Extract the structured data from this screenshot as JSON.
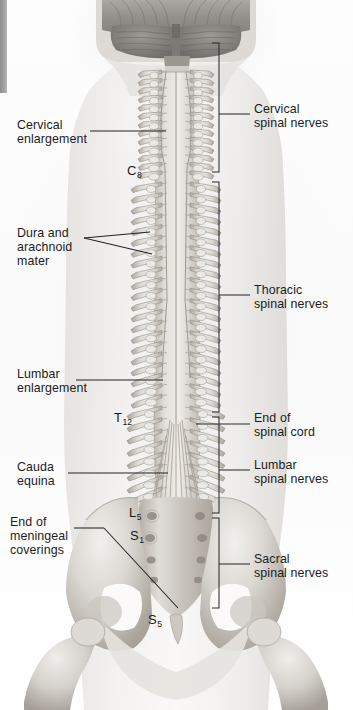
{
  "figure": {
    "style": "grayscale anatomical illustration",
    "width": 353,
    "height": 710
  },
  "colors": {
    "ink": "#1c1c1c",
    "leader_line": "#2a2a2a",
    "bracket": "#3a3a3a",
    "bone_light": "#e8e6e3",
    "bone_mid": "#c9c5c0",
    "bone_dark": "#9a948d",
    "cord": "#b9b4ae",
    "dura": "#d6d2cc",
    "brain": "#8e8a86",
    "margin_bar": "#9d9d9d",
    "background": "#ffffff"
  },
  "left_labels": [
    {
      "id": "cervical-enlargement",
      "lines": [
        "Cervical",
        "enlargement"
      ],
      "x": 17,
      "y": 124
    },
    {
      "id": "dura-arachnoid-mater",
      "lines": [
        "Dura and",
        "arachnoid",
        "mater"
      ],
      "x": 17,
      "y": 232
    },
    {
      "id": "lumbar-enlargement",
      "lines": [
        "Lumbar",
        "enlargement"
      ],
      "x": 17,
      "y": 373
    },
    {
      "id": "cauda-equina",
      "lines": [
        "Cauda",
        "equina"
      ],
      "x": 17,
      "y": 466
    },
    {
      "id": "end-of-meningeal-coverings",
      "lines": [
        "End of",
        "meningeal",
        "coverings"
      ],
      "x": 10,
      "y": 521
    }
  ],
  "right_labels": [
    {
      "id": "cervical-spinal-nerves",
      "lines": [
        "Cervical",
        "spinal nerves"
      ],
      "x": 254,
      "y": 108
    },
    {
      "id": "thoracic-spinal-nerves",
      "lines": [
        "Thoracic",
        "spinal nerves"
      ],
      "x": 254,
      "y": 289
    },
    {
      "id": "end-of-spinal-cord",
      "lines": [
        "End of",
        "spinal cord"
      ],
      "x": 254,
      "y": 417
    },
    {
      "id": "lumbar-spinal-nerves",
      "lines": [
        "Lumbar",
        "spinal nerves"
      ],
      "x": 254,
      "y": 464
    },
    {
      "id": "sacral-spinal-nerves",
      "lines": [
        "Sacral",
        "spinal nerves"
      ],
      "x": 254,
      "y": 558
    }
  ],
  "vertebral_markers": [
    {
      "id": "C8",
      "letter": "C",
      "number": "8",
      "x": 127,
      "y": 163
    },
    {
      "id": "T12",
      "letter": "T",
      "number": "12",
      "x": 114,
      "y": 410
    },
    {
      "id": "L5",
      "letter": "L",
      "number": "5",
      "x": 129,
      "y": 505
    },
    {
      "id": "S1",
      "letter": "S",
      "number": "1",
      "x": 130,
      "y": 528
    },
    {
      "id": "S5",
      "letter": "S",
      "number": "5",
      "x": 148,
      "y": 612
    }
  ],
  "brackets": [
    {
      "id": "cervical-bracket",
      "x": 219,
      "top": 43,
      "bottom": 172,
      "tick": 114
    },
    {
      "id": "thoracic-bracket",
      "x": 219,
      "top": 182,
      "bottom": 412,
      "tick": 295
    },
    {
      "id": "lumbar-bracket",
      "x": 219,
      "top": 417,
      "bottom": 513,
      "tick": 470
    },
    {
      "id": "sacral-bracket",
      "x": 219,
      "top": 518,
      "bottom": 608,
      "tick": 564
    }
  ],
  "anatomy_regions": [
    {
      "id": "cerebellum-brainstem",
      "label": "cerebellum and brainstem"
    },
    {
      "id": "cervical-vertebrae",
      "label": "cervical vertebrae"
    },
    {
      "id": "thoracic-vertebrae",
      "label": "thoracic vertebrae"
    },
    {
      "id": "lumbar-vertebrae",
      "label": "lumbar vertebrae"
    },
    {
      "id": "spinal-cord",
      "label": "spinal cord"
    },
    {
      "id": "cauda-equina-fibers",
      "label": "cauda equina"
    },
    {
      "id": "sacrum",
      "label": "sacrum"
    },
    {
      "id": "ilium-left",
      "label": "left ilium"
    },
    {
      "id": "ilium-right",
      "label": "right ilium"
    },
    {
      "id": "femur-left",
      "label": "left femur"
    },
    {
      "id": "femur-right",
      "label": "right femur"
    }
  ]
}
